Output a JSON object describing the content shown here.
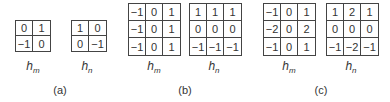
{
  "panels": [
    {
      "caption": "(a)",
      "hm": {
        "label": "h",
        "sub": "m",
        "values": [
          [
            "0",
            "1"
          ],
          [
            "-1",
            "0"
          ]
        ]
      },
      "hn": {
        "label": "h",
        "sub": "n",
        "values": [
          [
            "1",
            "0"
          ],
          [
            "0",
            "-1"
          ]
        ]
      }
    },
    {
      "caption": "(b)",
      "hm": {
        "label": "h",
        "sub": "m",
        "values": [
          [
            "-1",
            "0",
            "1"
          ],
          [
            "-1",
            "0",
            "1"
          ],
          [
            "-1",
            "0",
            "1"
          ]
        ]
      },
      "hn": {
        "label": "h",
        "sub": "n",
        "values": [
          [
            "1",
            "1",
            "1"
          ],
          [
            "0",
            "0",
            "0"
          ],
          [
            "-1",
            "-1",
            "-1"
          ]
        ]
      }
    },
    {
      "caption": "(c)",
      "hm": {
        "label": "h",
        "sub": "m",
        "values": [
          [
            "-1",
            "0",
            "1"
          ],
          [
            "-2",
            "0",
            "2"
          ],
          [
            "-1",
            "0",
            "1"
          ]
        ]
      },
      "hn": {
        "label": "h",
        "sub": "n",
        "values": [
          [
            "1",
            "2",
            "1"
          ],
          [
            "0",
            "0",
            "0"
          ],
          [
            "-1",
            "-2",
            "-1"
          ]
        ]
      }
    }
  ]
}
